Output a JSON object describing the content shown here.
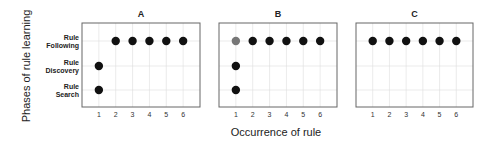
{
  "chart_data": {
    "type": "scatter",
    "ylabel": "Phases of rule learning",
    "xlabel": "Occurrence of rule",
    "y_categories": [
      {
        "key": "search",
        "lines": [
          "Rule",
          "Search"
        ]
      },
      {
        "key": "discovery",
        "lines": [
          "Rule",
          "Discovery"
        ]
      },
      {
        "key": "following",
        "lines": [
          "Rule",
          "Following"
        ]
      }
    ],
    "x_ticks": [
      "1",
      "2",
      "3",
      "4",
      "5",
      "6"
    ],
    "xlim": [
      0,
      7
    ],
    "grid": true,
    "colors": {
      "dot": "#111111",
      "dot_highlight": "#777777",
      "frame": "#666666",
      "grid": "#dddddd"
    },
    "panels": [
      {
        "title": "A",
        "points": [
          {
            "x": 1,
            "phase": "search"
          },
          {
            "x": 1,
            "phase": "discovery"
          },
          {
            "x": 2,
            "phase": "following"
          },
          {
            "x": 3,
            "phase": "following"
          },
          {
            "x": 4,
            "phase": "following"
          },
          {
            "x": 5,
            "phase": "following"
          },
          {
            "x": 6,
            "phase": "following"
          }
        ]
      },
      {
        "title": "B",
        "points": [
          {
            "x": 1,
            "phase": "search"
          },
          {
            "x": 1,
            "phase": "discovery"
          },
          {
            "x": 1,
            "phase": "following",
            "highlight": true
          },
          {
            "x": 2,
            "phase": "following"
          },
          {
            "x": 3,
            "phase": "following"
          },
          {
            "x": 4,
            "phase": "following"
          },
          {
            "x": 5,
            "phase": "following"
          },
          {
            "x": 6,
            "phase": "following"
          }
        ]
      },
      {
        "title": "C",
        "points": [
          {
            "x": 1,
            "phase": "following"
          },
          {
            "x": 2,
            "phase": "following"
          },
          {
            "x": 3,
            "phase": "following"
          },
          {
            "x": 4,
            "phase": "following"
          },
          {
            "x": 5,
            "phase": "following"
          },
          {
            "x": 6,
            "phase": "following"
          }
        ]
      }
    ]
  }
}
